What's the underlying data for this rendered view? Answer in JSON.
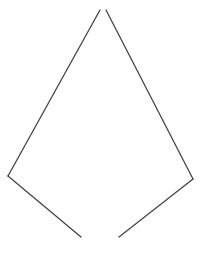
{
  "diagram": {
    "background": "#ffffff",
    "stroke_color": "#444444",
    "stroke_width": 1.3,
    "segments": [
      {
        "name": "upper-left-edge",
        "x1": 100,
        "y1": 10,
        "x2": 8,
        "y2": 176
      },
      {
        "name": "lower-left-edge",
        "x1": 8,
        "y1": 176,
        "x2": 81,
        "y2": 237
      },
      {
        "name": "upper-right-edge",
        "x1": 106,
        "y1": 10,
        "x2": 193,
        "y2": 179
      },
      {
        "name": "lower-right-edge",
        "x1": 193,
        "y1": 179,
        "x2": 119,
        "y2": 237
      }
    ]
  }
}
